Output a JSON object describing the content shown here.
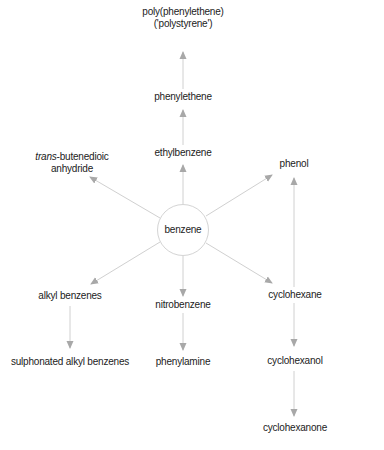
{
  "diagram": {
    "center": {
      "label": "benzene"
    },
    "nodes": {
      "polystyrene_line1": "poly(phenylethene)",
      "polystyrene_line2": "('polystyrene')",
      "phenylethene": "phenylethene",
      "ethylbenzene": "ethylbenzene",
      "butenedioic_italic": "trans",
      "butenedioic_rest": "-butenedioic",
      "butenedioic_line2": "anhydride",
      "phenol": "phenol",
      "alkyl_benzenes": "alkyl benzenes",
      "nitrobenzene": "nitrobenzene",
      "cyclohexane": "cyclohexane",
      "sulphonated": "sulphonated alkyl benzenes",
      "phenylamine": "phenylamine",
      "cyclohexanol": "cyclohexanol",
      "cyclohexanone": "cyclohexanone"
    },
    "edges": [
      {
        "from": "benzene",
        "to": "ethylbenzene"
      },
      {
        "from": "ethylbenzene",
        "to": "phenylethene"
      },
      {
        "from": "phenylethene",
        "to": "poly(phenylethene)"
      },
      {
        "from": "benzene",
        "to": "trans-butenedioic anhydride"
      },
      {
        "from": "benzene",
        "to": "phenol"
      },
      {
        "from": "benzene",
        "to": "alkyl benzenes"
      },
      {
        "from": "benzene",
        "to": "nitrobenzene"
      },
      {
        "from": "benzene",
        "to": "cyclohexane"
      },
      {
        "from": "alkyl benzenes",
        "to": "sulphonated alkyl benzenes"
      },
      {
        "from": "nitrobenzene",
        "to": "phenylamine"
      },
      {
        "from": "cyclohexane",
        "to": "phenol"
      },
      {
        "from": "cyclohexane",
        "to": "cyclohexanol"
      },
      {
        "from": "cyclohexanol",
        "to": "cyclohexanone"
      }
    ],
    "colors": {
      "text": "#222222",
      "line": "#d0d0d0",
      "arrowhead": "#a8a8a8",
      "circle": "#d4d4d4"
    }
  }
}
